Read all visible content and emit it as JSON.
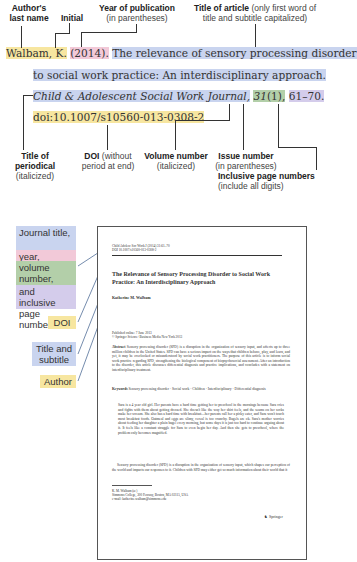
{
  "top_labels": {
    "author": {
      "bold": "Author's last name",
      "sub": ""
    },
    "initial": {
      "bold": "Initial",
      "sub": ""
    },
    "year": {
      "bold": "Year of publication",
      "sub": "(in parentheses)"
    },
    "title": {
      "bold": "Title of article",
      "sub": "(only first word of title and subtitle capitalized)"
    }
  },
  "citation": {
    "author": "Walbam, K.",
    "year": "(2014).",
    "title_line1": "The relevance of sensory processing disorder",
    "title_line2": "to social work practice: An interdisciplinary approach.",
    "journal": "Child & Adolescent Social Work Journal,",
    "volume": "31",
    "issue": "(1),",
    "pages": "61–70.",
    "doi": "doi:10.1007/s10560-013-0308-2"
  },
  "bottom_labels": {
    "periodical": {
      "bold": "Title of periodical",
      "sub": "(italicized)"
    },
    "doi": {
      "bold": "DOI",
      "sub": "(without period at end)"
    },
    "volume": {
      "bold": "Volume number",
      "sub": "(italicized)"
    },
    "issue": {
      "bold": "Issue number",
      "sub": "(in parentheses)"
    },
    "pages": {
      "bold": "Inclusive page numbers",
      "sub": "(include all digits)"
    }
  },
  "side_tags": {
    "journal": "Journal title,",
    "year": "year,",
    "volume": "volume number,",
    "pages": "and inclusive page numbers",
    "doi": "DOI",
    "title": "Title and subtitle",
    "author": "Author"
  },
  "colors": {
    "yellow": "#f7e6a0",
    "pink": "#f2c9d8",
    "blue": "#c9d4ef",
    "green": "#b3cfa9",
    "violet": "#d4cceb"
  },
  "paper": {
    "header_line1": "Child Adolesc Soc Work J (2014) 31:61–70",
    "header_line2": "DOI 10.1007/s10560-013-0308-2",
    "title": "The Relevance of Sensory Processing Disorder to Social Work Practice: An Interdisciplinary Approach",
    "author": "Katherine M. Walbam",
    "published": "Published online: 7 June 2013",
    "copyright": "© Springer Science+Business Media New York 2013",
    "abstract_label": "Abstract",
    "abstract": "Sensory processing disorder (SPD) is a disruption in the organization of sensory input, and affects up to three million children in the United States. SPD can have a serious impact on the ways that children behave, play, and learn, and yet, it may be overlooked or misunderstood by social work practitioners. The purpose of this article is to inform social work practice regarding SPD, strengthening the biological component of biopsychosocial assessment. After an introduction to the disorder, this article discusses differential diagnosis and practice implications, and concludes with a statement on interdisciplinary treatment.",
    "keywords_label": "Keywords",
    "keywords": "Sensory processing disorder · Social work · Children · Interdisciplinary · Differential diagnosis",
    "body1": "Sara is a 4 year old girl. Her parents have a hard time getting her to preschool in the mornings because Sara cries and fights with them about getting dressed. She doesn't like the way her shirt feels, and the seams on her socks make her scream. She also has a hard time with breakfast—her parents call her a picky eater, and Sara won't touch most breakfast foods. Oatmeal and eggs are slimy, cereal is too crunchy. Bagels are ok. Sara's mother worries about feeding her daughter a plain bagel every morning, but some days it is just too hard to continue arguing about it. It feels like a constant struggle for Sara to even begin her day. And then she gets to preschool, where the problem only becomes magnified.",
    "body2": "Sensory processing disorder (SPD) is a disruption in the organization of sensory input, which shapes our perception of the world and impacts our responses to it. Children with SPD may either get so much information about their world that it",
    "footnote1": "K. M. Walbam (✉)",
    "footnote2": "Simmons College, 300 Fenway, Boston, MA 02115, USA",
    "footnote3": "e-mail: katherine.walbam@simmons.edu",
    "publisher": "Springer"
  }
}
